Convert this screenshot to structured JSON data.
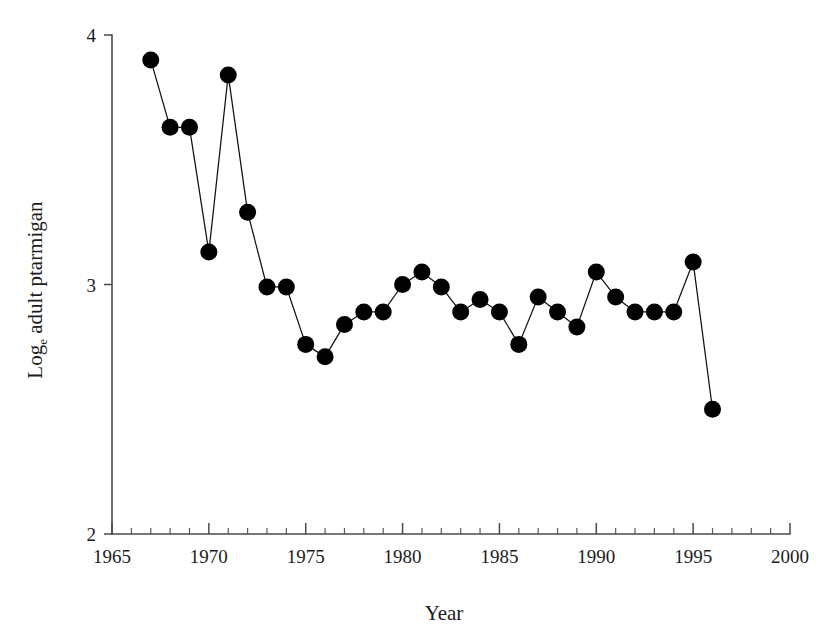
{
  "chart_data": {
    "type": "line",
    "title": "",
    "subtitle": "",
    "xlabel": "Year",
    "ylabel": "Log_e adult ptarmigan",
    "ylabel_main": "Log",
    "ylabel_sub": "e",
    "ylabel_rest": " adult ptarmigan",
    "xlim": [
      1965,
      2000
    ],
    "ylim": [
      2,
      4
    ],
    "grid": false,
    "legend": "none",
    "markers": "filled-circle",
    "marker_color": "#000000",
    "line_color": "#111111",
    "x_major_ticks": [
      1965,
      1970,
      1975,
      1980,
      1985,
      1990,
      1995,
      2000
    ],
    "x_major_tick_labels": [
      "1965",
      "1970",
      "1975",
      "1980",
      "1985",
      "1990",
      "1995",
      "2000"
    ],
    "x_minor_tick_step": 1,
    "y_major_ticks": [
      2,
      3,
      4
    ],
    "y_major_tick_labels": [
      "2",
      "3",
      "4"
    ],
    "x": [
      1967,
      1968,
      1969,
      1970,
      1971,
      1972,
      1973,
      1974,
      1975,
      1976,
      1977,
      1978,
      1979,
      1980,
      1981,
      1982,
      1983,
      1984,
      1985,
      1986,
      1987,
      1988,
      1989,
      1990,
      1991,
      1992,
      1993,
      1994,
      1995,
      1996
    ],
    "values": [
      3.9,
      3.63,
      3.63,
      3.13,
      3.84,
      3.29,
      2.99,
      2.99,
      2.76,
      2.71,
      2.84,
      2.89,
      2.89,
      3.0,
      3.05,
      2.99,
      2.89,
      2.94,
      2.89,
      2.76,
      2.95,
      2.89,
      2.83,
      3.05,
      2.95,
      2.89,
      2.89,
      2.89,
      3.09,
      2.5
    ],
    "series": [
      {
        "name": "Log_e adult ptarmigan",
        "x": [
          1967,
          1968,
          1969,
          1970,
          1971,
          1972,
          1973,
          1974,
          1975,
          1976,
          1977,
          1978,
          1979,
          1980,
          1981,
          1982,
          1983,
          1984,
          1985,
          1986,
          1987,
          1988,
          1989,
          1990,
          1991,
          1992,
          1993,
          1994,
          1995,
          1996
        ],
        "values": [
          3.9,
          3.63,
          3.63,
          3.13,
          3.84,
          3.29,
          2.99,
          2.99,
          2.76,
          2.71,
          2.84,
          2.89,
          2.89,
          3.0,
          3.05,
          2.99,
          2.89,
          2.94,
          2.89,
          2.76,
          2.95,
          2.89,
          2.83,
          3.05,
          2.95,
          2.89,
          2.89,
          2.89,
          3.09,
          2.5
        ]
      }
    ]
  }
}
